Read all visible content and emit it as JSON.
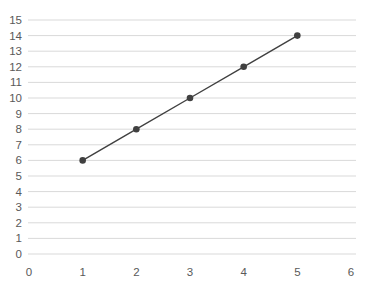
{
  "chart_data": {
    "type": "scatter",
    "title": "",
    "xlabel": "",
    "ylabel": "",
    "series": [
      {
        "name": "Series 1",
        "points": [
          [
            1,
            6
          ],
          [
            2,
            8
          ],
          [
            3,
            10
          ],
          [
            4,
            12
          ],
          [
            5,
            14
          ]
        ]
      }
    ],
    "xlim": [
      0,
      6
    ],
    "ylim": [
      0,
      15
    ],
    "x_ticks": [
      0,
      1,
      2,
      3,
      4,
      5,
      6
    ],
    "y_ticks": [
      0,
      1,
      2,
      3,
      4,
      5,
      6,
      7,
      8,
      9,
      10,
      11,
      12,
      13,
      14,
      15
    ],
    "grid": "horizontal",
    "legend_position": "none",
    "marker": "circle",
    "line_style": "solid",
    "colors": {
      "line": "#404040",
      "marker": "#404040",
      "gridline": "#d9d9d9",
      "tick_label": "#595959",
      "background": "#ffffff"
    }
  }
}
